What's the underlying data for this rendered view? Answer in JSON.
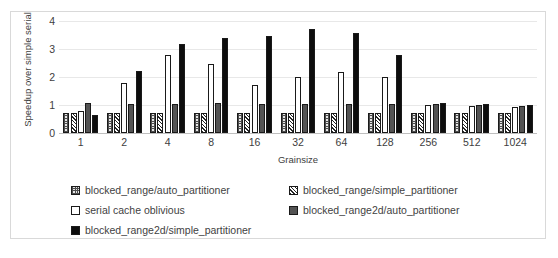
{
  "chart_data": {
    "type": "bar",
    "title": "",
    "xlabel": "Grainsize",
    "ylabel": "Speedup over simple serial",
    "ylim": [
      0,
      4
    ],
    "yticks": [
      0,
      1,
      2,
      3,
      4
    ],
    "grid": true,
    "legend_position": "bottom",
    "categories": [
      "1",
      "2",
      "4",
      "8",
      "16",
      "32",
      "64",
      "128",
      "256",
      "512",
      "1024"
    ],
    "series": [
      {
        "name": "blocked_range/auto_partitioner",
        "fill": "light-checker",
        "color": "#e6e6e6",
        "values": [
          0.7,
          0.7,
          0.7,
          0.7,
          0.7,
          0.7,
          0.7,
          0.7,
          0.7,
          0.7,
          0.7
        ]
      },
      {
        "name": "blocked_range/simple_partitioner",
        "fill": "diagonal-hatch",
        "color": "#ffffff",
        "values": [
          0.7,
          0.7,
          0.7,
          0.7,
          0.7,
          0.7,
          0.7,
          0.7,
          0.72,
          0.72,
          0.72
        ]
      },
      {
        "name": "serial cache oblivious",
        "fill": "solid-white",
        "color": "#ffffff",
        "values": [
          0.8,
          1.8,
          2.78,
          2.48,
          1.72,
          2.0,
          2.18,
          2.0,
          1.0,
          0.96,
          0.92
        ]
      },
      {
        "name": "blocked_range2d/auto_partitioner",
        "fill": "solid-dark-grey",
        "color": "#535353",
        "values": [
          1.06,
          1.05,
          1.04,
          1.06,
          1.05,
          1.04,
          1.05,
          1.04,
          1.02,
          1.0,
          0.98
        ]
      },
      {
        "name": "blocked_range2d/simple_partitioner",
        "fill": "solid-black",
        "color": "#0d0d0d",
        "values": [
          0.64,
          2.2,
          3.18,
          3.38,
          3.46,
          3.7,
          3.58,
          2.8,
          1.08,
          1.04,
          1.0
        ]
      }
    ]
  },
  "legend": {
    "items": [
      {
        "label": "blocked_range/auto_partitioner",
        "swatch": "light-checker"
      },
      {
        "label": "blocked_range/simple_partitioner",
        "swatch": "diagonal-hatch"
      },
      {
        "label": "serial cache oblivious",
        "swatch": "solid-white"
      },
      {
        "label": "blocked_range2d/auto_partitioner",
        "swatch": "solid-dark-grey"
      },
      {
        "label": "blocked_range2d/simple_partitioner",
        "swatch": "solid-black"
      }
    ]
  }
}
